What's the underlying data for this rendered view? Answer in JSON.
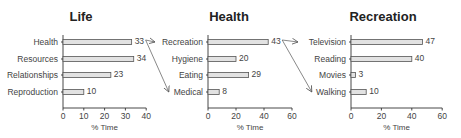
{
  "chart_data": [
    {
      "type": "bar",
      "orientation": "horizontal",
      "title": "Life",
      "categories": [
        "Health",
        "Resources",
        "Relationships",
        "Reproduction"
      ],
      "values": [
        33,
        34,
        23,
        10
      ],
      "xlabel": "% Time",
      "ylabel": "",
      "xlim": [
        0,
        40
      ],
      "xticks": [
        0,
        10,
        20,
        30,
        40
      ],
      "grid": false,
      "legend": null
    },
    {
      "type": "bar",
      "orientation": "horizontal",
      "title": "Health",
      "categories": [
        "Recreation",
        "Hygiene",
        "Eating",
        "Medical"
      ],
      "values": [
        43,
        20,
        29,
        8
      ],
      "xlabel": "% Time",
      "ylabel": "",
      "xlim": [
        0,
        60
      ],
      "xticks": [
        0,
        20,
        40,
        60
      ],
      "grid": false,
      "legend": null
    },
    {
      "type": "bar",
      "orientation": "horizontal",
      "title": "Recreation",
      "categories": [
        "Television",
        "Reading",
        "Movies",
        "Walking"
      ],
      "values": [
        47,
        40,
        3,
        10
      ],
      "xlabel": "% Time",
      "ylabel": "",
      "xlim": [
        0,
        60
      ],
      "xticks": [
        0,
        20,
        40,
        60
      ],
      "grid": false,
      "legend": null
    }
  ],
  "annotations": [
    {
      "from": "Life.Health",
      "to": "Health.Recreation",
      "type": "arrow"
    },
    {
      "from": "Life.Health",
      "to": "Health.Medical",
      "type": "arrow"
    },
    {
      "from": "Health.Recreation",
      "to": "Recreation.Television",
      "type": "arrow"
    },
    {
      "from": "Health.Recreation",
      "to": "Recreation.Walking",
      "type": "arrow"
    }
  ]
}
